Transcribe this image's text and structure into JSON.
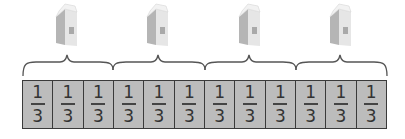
{
  "diagram": {
    "groups": [
      {
        "object": "milk-carton",
        "parts": 3
      },
      {
        "object": "milk-carton",
        "parts": 3
      },
      {
        "object": "milk-carton",
        "parts": 3
      },
      {
        "object": "milk-carton",
        "parts": 3
      }
    ],
    "fraction_bar": {
      "cells": [
        {
          "numerator": "1",
          "denominator": "3"
        },
        {
          "numerator": "1",
          "denominator": "3"
        },
        {
          "numerator": "1",
          "denominator": "3"
        },
        {
          "numerator": "1",
          "denominator": "3"
        },
        {
          "numerator": "1",
          "denominator": "3"
        },
        {
          "numerator": "1",
          "denominator": "3"
        },
        {
          "numerator": "1",
          "denominator": "3"
        },
        {
          "numerator": "1",
          "denominator": "3"
        },
        {
          "numerator": "1",
          "denominator": "3"
        },
        {
          "numerator": "1",
          "denominator": "3"
        },
        {
          "numerator": "1",
          "denominator": "3"
        },
        {
          "numerator": "1",
          "denominator": "3"
        }
      ],
      "cell_fill": "#bcbcbc",
      "border_color": "#3a3a3a"
    },
    "colors": {
      "brace": "#555555",
      "carton_front": "#e8e8e8",
      "carton_side": "#b5b5b5",
      "carton_top": "#f2f2f2"
    }
  }
}
